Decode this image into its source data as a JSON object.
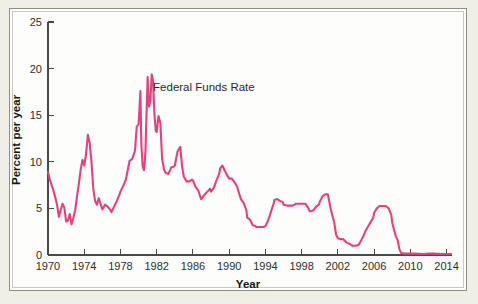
{
  "figure": {
    "background_color": "#efeee7",
    "card_color": "#fdfdfb",
    "frame_color": "#8e8d86"
  },
  "chart_data": {
    "type": "line",
    "title": "",
    "xlabel": "Year",
    "ylabel": "Percent per year",
    "xlim": [
      1970,
      2014.6
    ],
    "ylim": [
      0,
      25
    ],
    "grid": false,
    "legend_position": "inline-annotation",
    "annotations": [
      {
        "text": "Federal Funds Rate",
        "x": 1981.6,
        "y": 17.6
      }
    ],
    "xticks": [
      1970,
      1974,
      1978,
      1982,
      1986,
      1990,
      1994,
      1998,
      2002,
      2006,
      2010,
      2014
    ],
    "xtick_labels": [
      "1970",
      "1974",
      "1978",
      "1982",
      "1986",
      "1990",
      "1994",
      "1998",
      "2002",
      "2006",
      "2010",
      "2014"
    ],
    "yticks": [
      0,
      5,
      10,
      15,
      20,
      25
    ],
    "ytick_labels": [
      "0",
      "5",
      "10",
      "15",
      "20",
      "25"
    ],
    "series": [
      {
        "name": "Federal Funds Rate",
        "color": "#e8407c",
        "units": "percent per year",
        "x": [
          1970.0,
          1970.2,
          1970.4,
          1970.6,
          1970.8,
          1971.0,
          1971.2,
          1971.4,
          1971.6,
          1971.8,
          1972.0,
          1972.2,
          1972.4,
          1972.6,
          1972.8,
          1973.0,
          1973.2,
          1973.4,
          1973.6,
          1973.8,
          1974.0,
          1974.2,
          1974.4,
          1974.6,
          1974.8,
          1975.0,
          1975.2,
          1975.4,
          1975.6,
          1975.8,
          1976.0,
          1976.3,
          1976.6,
          1976.9,
          1977.0,
          1977.3,
          1977.6,
          1977.9,
          1978.0,
          1978.3,
          1978.6,
          1978.9,
          1979.0,
          1979.3,
          1979.6,
          1979.8,
          1980.0,
          1980.2,
          1980.3,
          1980.45,
          1980.6,
          1980.75,
          1980.9,
          1981.0,
          1981.15,
          1981.3,
          1981.45,
          1981.6,
          1981.75,
          1981.9,
          1982.0,
          1982.2,
          1982.4,
          1982.6,
          1982.8,
          1983.0,
          1983.3,
          1983.6,
          1983.9,
          1984.0,
          1984.3,
          1984.6,
          1984.8,
          1985.0,
          1985.3,
          1985.6,
          1985.9,
          1986.0,
          1986.3,
          1986.6,
          1986.9,
          1987.0,
          1987.3,
          1987.6,
          1987.9,
          1988.0,
          1988.3,
          1988.6,
          1988.9,
          1989.0,
          1989.25,
          1989.5,
          1989.75,
          1990.0,
          1990.3,
          1990.6,
          1990.9,
          1991.0,
          1991.3,
          1991.6,
          1991.9,
          1992.0,
          1992.3,
          1992.6,
          1992.9,
          1993.0,
          1993.4,
          1993.8,
          1994.0,
          1994.3,
          1994.6,
          1994.9,
          1995.0,
          1995.3,
          1995.6,
          1995.9,
          1996.0,
          1996.4,
          1996.8,
          1997.0,
          1997.4,
          1997.8,
          1998.0,
          1998.4,
          1998.7,
          1998.9,
          1999.0,
          1999.3,
          1999.6,
          1999.9,
          2000.0,
          2000.3,
          2000.6,
          2000.9,
          2001.0,
          2001.2,
          2001.4,
          2001.6,
          2001.8,
          2002.0,
          2002.3,
          2002.6,
          2002.9,
          2003.0,
          2003.3,
          2003.6,
          2003.9,
          2004.0,
          2004.3,
          2004.6,
          2004.9,
          2005.0,
          2005.3,
          2005.6,
          2005.9,
          2006.0,
          2006.3,
          2006.6,
          2006.9,
          2007.0,
          2007.3,
          2007.6,
          2007.9,
          2008.0,
          2008.2,
          2008.4,
          2008.6,
          2008.8,
          2009.0,
          2009.4,
          2009.8,
          2010.0,
          2010.5,
          2011.0,
          2011.5,
          2012.0,
          2012.5,
          2013.0,
          2013.5,
          2014.0,
          2014.5
        ],
        "y": [
          8.9,
          8.1,
          7.5,
          6.9,
          6.2,
          5.4,
          4.1,
          4.8,
          5.5,
          5.1,
          3.6,
          3.7,
          4.4,
          3.3,
          4.0,
          4.8,
          6.3,
          7.6,
          9.1,
          10.2,
          9.6,
          10.8,
          12.9,
          12.0,
          10.0,
          7.1,
          5.8,
          5.4,
          6.1,
          5.5,
          4.9,
          5.4,
          5.2,
          4.8,
          4.6,
          5.2,
          5.8,
          6.5,
          6.8,
          7.4,
          8.1,
          9.6,
          10.1,
          10.3,
          11.2,
          13.8,
          14.0,
          17.6,
          12.0,
          9.5,
          9.1,
          10.9,
          15.9,
          19.1,
          15.9,
          16.6,
          19.4,
          18.6,
          15.1,
          13.3,
          13.2,
          14.9,
          14.2,
          10.3,
          9.2,
          8.8,
          8.7,
          9.4,
          9.5,
          9.6,
          11.1,
          11.6,
          9.5,
          8.4,
          7.9,
          7.9,
          8.1,
          8.0,
          7.3,
          6.9,
          6.0,
          6.1,
          6.5,
          6.8,
          7.1,
          6.8,
          7.2,
          8.0,
          8.7,
          9.3,
          9.6,
          9.1,
          8.6,
          8.2,
          8.2,
          7.8,
          7.3,
          6.9,
          6.0,
          5.6,
          4.8,
          4.0,
          3.8,
          3.2,
          3.1,
          3.0,
          3.0,
          3.0,
          3.1,
          3.7,
          4.6,
          5.5,
          5.9,
          6.0,
          5.8,
          5.7,
          5.4,
          5.3,
          5.3,
          5.3,
          5.5,
          5.5,
          5.5,
          5.5,
          5.1,
          4.7,
          4.7,
          4.8,
          5.2,
          5.4,
          5.7,
          6.3,
          6.5,
          6.5,
          6.0,
          5.0,
          4.2,
          3.5,
          2.2,
          1.8,
          1.7,
          1.7,
          1.4,
          1.3,
          1.2,
          1.0,
          1.0,
          1.0,
          1.1,
          1.6,
          2.2,
          2.5,
          3.0,
          3.5,
          4.0,
          4.5,
          5.0,
          5.25,
          5.25,
          5.25,
          5.25,
          5.0,
          4.3,
          3.5,
          2.7,
          2.0,
          1.6,
          0.6,
          0.2,
          0.15,
          0.15,
          0.15,
          0.15,
          0.12,
          0.1,
          0.15,
          0.15,
          0.12,
          0.1,
          0.1,
          0.1
        ]
      }
    ]
  }
}
